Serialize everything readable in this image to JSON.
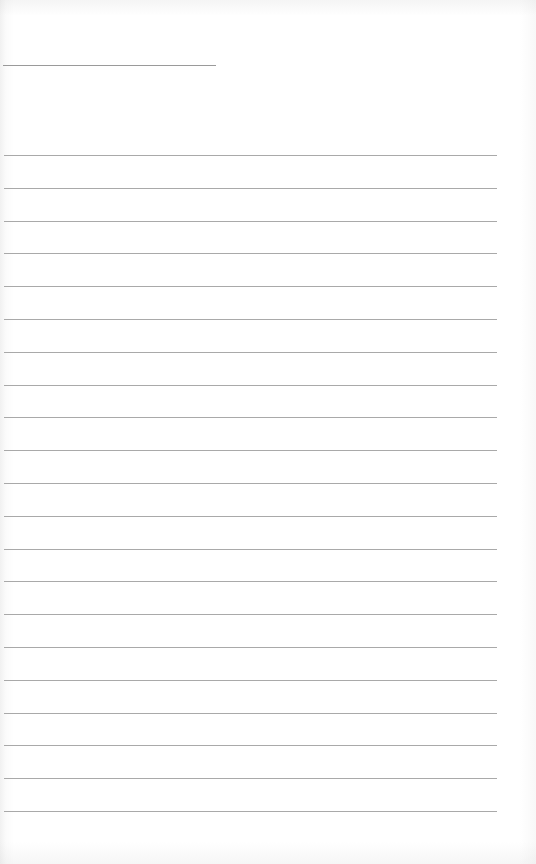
{
  "page": {
    "type": "ruled-notebook-page",
    "title_line": {
      "label": ""
    },
    "ruled_lines": [
      {
        "value": ""
      },
      {
        "value": ""
      },
      {
        "value": ""
      },
      {
        "value": ""
      },
      {
        "value": ""
      },
      {
        "value": ""
      },
      {
        "value": ""
      },
      {
        "value": ""
      },
      {
        "value": ""
      },
      {
        "value": ""
      },
      {
        "value": ""
      },
      {
        "value": ""
      },
      {
        "value": ""
      },
      {
        "value": ""
      },
      {
        "value": ""
      },
      {
        "value": ""
      },
      {
        "value": ""
      },
      {
        "value": ""
      },
      {
        "value": ""
      },
      {
        "value": ""
      },
      {
        "value": ""
      }
    ],
    "colors": {
      "paper": "#ffffff",
      "line": "#a9a9a9"
    }
  }
}
